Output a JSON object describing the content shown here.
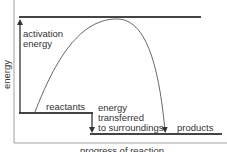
{
  "diagram": {
    "type": "energy-profile",
    "y_axis_label": "energy",
    "x_axis_label": "progress of reaction",
    "labels": {
      "activation_line1": "activation",
      "activation_line2": "energy",
      "reactants": "reactants",
      "transfer_line1": "energy",
      "transfer_line2": "transferred",
      "transfer_line3": "to surroundings",
      "products": "products"
    },
    "colors": {
      "axis": "#999999",
      "level_lines": "#444444",
      "curve": "#555555",
      "text": "#333333"
    }
  }
}
